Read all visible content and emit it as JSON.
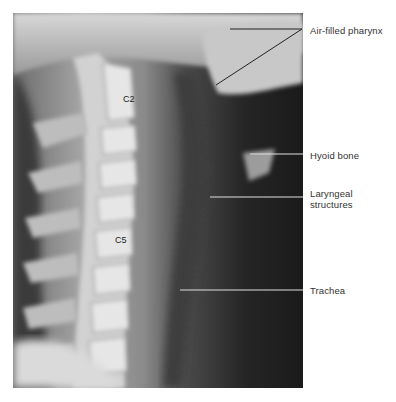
{
  "figure": {
    "vertebra_labels": [
      {
        "id": "c2",
        "text": "C2"
      },
      {
        "id": "c5",
        "text": "C5"
      }
    ],
    "annotations": [
      {
        "id": "pharynx",
        "text": "Air-filled pharynx"
      },
      {
        "id": "hyoid",
        "text": "Hyoid bone"
      },
      {
        "id": "laryngeal",
        "text": "Laryngeal structures"
      },
      {
        "id": "trachea",
        "text": "Trachea"
      }
    ],
    "colors": {
      "background": "#ffffff",
      "label_text": "#333333",
      "leader_line_dark": "#222222",
      "leader_line_light": "#e0e0e0"
    }
  }
}
